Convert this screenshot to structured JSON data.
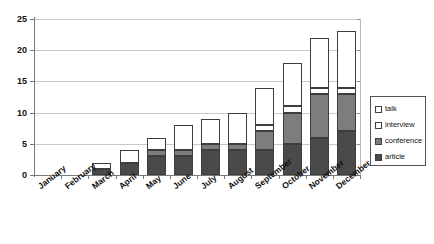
{
  "chart_data": {
    "type": "bar",
    "title": "",
    "subtitle": "",
    "xlabel": "",
    "ylabel": "",
    "stacked": true,
    "grid": true,
    "legend_position": "right",
    "ylim": [
      0,
      25
    ],
    "yticks": [
      0,
      5,
      10,
      15,
      20,
      25
    ],
    "categories": [
      "January",
      "February",
      "March",
      "April",
      "May",
      "June",
      "July",
      "August",
      "September",
      "October",
      "November",
      "December"
    ],
    "series": [
      {
        "name": "article",
        "color": "#4a4a4a",
        "values": [
          0,
          0,
          1,
          2,
          3,
          3,
          4,
          4,
          4,
          5,
          6,
          7
        ]
      },
      {
        "name": "conference",
        "color": "#7d7d7d",
        "values": [
          0,
          0,
          0,
          0,
          1,
          1,
          1,
          1,
          3,
          5,
          7,
          6
        ]
      },
      {
        "name": "interview",
        "color": "#ffffff",
        "values": [
          0,
          0,
          0,
          0,
          0,
          0,
          0,
          0,
          1,
          1,
          1,
          1
        ]
      },
      {
        "name": "talk",
        "color": "#ffffff",
        "values": [
          0,
          0,
          1,
          2,
          2,
          4,
          4,
          5,
          6,
          7,
          8,
          9
        ]
      }
    ],
    "totals": [
      0,
      0,
      2,
      4,
      6,
      8,
      9,
      10,
      14,
      18,
      22,
      23
    ]
  },
  "yaxis": {
    "labels": [
      "25",
      "20",
      "15",
      "10",
      "5",
      "0"
    ]
  },
  "xaxis": {
    "labels": [
      "January",
      "February",
      "March",
      "April",
      "May",
      "June",
      "July",
      "August",
      "September",
      "October",
      "November",
      "December"
    ]
  },
  "legend": {
    "items": [
      {
        "label": "talk",
        "swatch": "legend-swatch-talk"
      },
      {
        "label": "interview",
        "swatch": "legend-swatch-interview"
      },
      {
        "label": "conference",
        "swatch": "legend-swatch-conference"
      },
      {
        "label": "article",
        "swatch": "legend-swatch-article"
      }
    ]
  }
}
